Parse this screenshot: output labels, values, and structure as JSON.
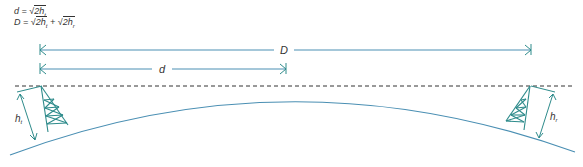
{
  "formulas": {
    "line1": {
      "lhs": "d",
      "eq": " = ",
      "rad": "√",
      "term": "2h",
      "sub": "t"
    },
    "line2": {
      "lhs": "D",
      "eq": " = ",
      "rad1": "√",
      "term1": "2h",
      "sub1": "t",
      "plus": " + ",
      "rad2": "√",
      "term2": "2h",
      "sub2": "r"
    }
  },
  "labels": {
    "D": "D",
    "d": "d",
    "ht_main": "h",
    "ht_sub": "t",
    "hr_main": "h",
    "hr_sub": "r"
  },
  "colors": {
    "teal": "#2e8b8b",
    "blue": "#4a8fb3",
    "dash": "#333333",
    "text": "#333333"
  }
}
